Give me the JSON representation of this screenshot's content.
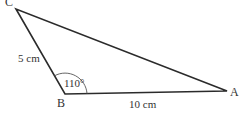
{
  "diagram": {
    "type": "triangle",
    "vertices": {
      "A": {
        "label": "A",
        "x": 227,
        "y": 91
      },
      "B": {
        "label": "B",
        "x": 65,
        "y": 94
      },
      "C": {
        "label": "C",
        "x": 16,
        "y": 9
      }
    },
    "sides": {
      "BC": {
        "label": "5 cm"
      },
      "AB": {
        "label": "10 cm"
      }
    },
    "angle_B": {
      "label": "110°"
    },
    "stroke_color": "#2b2b2b"
  }
}
